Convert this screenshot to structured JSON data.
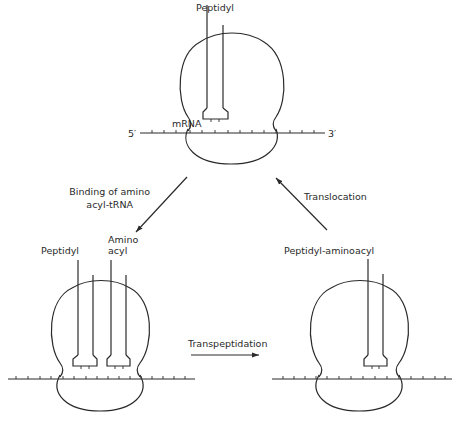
{
  "diagram": {
    "type": "ribosome-elongation-cycle",
    "colors": {
      "stroke": "#2a2a2a",
      "background": "#ffffff"
    },
    "states": {
      "top": {
        "trna_labels": [
          "Peptidyl"
        ],
        "mrna_label": "mRNA",
        "five_prime": "5′",
        "three_prime": "3′"
      },
      "bottom_left": {
        "trna_labels": [
          "Peptidyl",
          "Amino",
          "acyl"
        ]
      },
      "bottom_right": {
        "trna_labels": [
          "Peptidyl-aminoacyl"
        ]
      }
    },
    "steps": [
      {
        "label_line1": "Binding of amino",
        "label_line2": "acyl-tRNA",
        "from": "top",
        "to": "bottom_left"
      },
      {
        "label_line1": "Transpeptidation",
        "from": "bottom_left",
        "to": "bottom_right"
      },
      {
        "label_line1": "Translocation",
        "from": "bottom_right",
        "to": "top"
      }
    ]
  }
}
